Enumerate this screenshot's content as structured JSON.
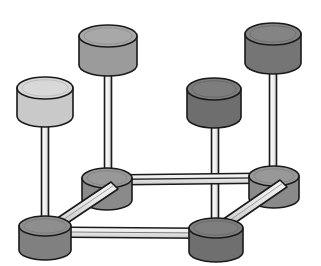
{
  "scene": {
    "title": "3D isometric cylinder-and-strut structure",
    "background_color": "#ffffff",
    "width": 321,
    "height": 266,
    "outline_color": "#1a1a1a",
    "node_count": 8,
    "strut_count": 4,
    "pole_count": 4
  },
  "palette": {
    "light_gray": "#c9c9c9",
    "light_gray_top": "#d8d8d8",
    "medium_gray": "#9b9b9b",
    "medium_gray_top": "#a8a8a8",
    "dark_gray": "#6e6e6e",
    "dark_gray_top": "#7d7d7d",
    "base_gray": "#8a8a8a",
    "base_gray_top": "#989898",
    "strut_light": "#e8e8e8",
    "strut_shade": "#c4c4c4",
    "pole_light": "#f2f2f2",
    "pole_shade": "#cfcfcf",
    "outline": "#1a1a1a"
  },
  "top_cylinders": [
    {
      "id": "top-cylinder-left",
      "label": "Light gray cap",
      "shade": "light",
      "fill": "#c9c9c9",
      "top_fill": "#d8d8d8",
      "cx": 45,
      "cy": 88,
      "rx": 28,
      "ry": 11,
      "body_height": 28
    },
    {
      "id": "top-cylinder-back-left",
      "label": "Medium gray cap",
      "shade": "medium",
      "fill": "#9b9b9b",
      "top_fill": "#a8a8a8",
      "cx": 108,
      "cy": 36,
      "rx": 29,
      "ry": 11,
      "body_height": 29
    },
    {
      "id": "top-cylinder-center-right",
      "label": "Dark gray cap",
      "shade": "dark",
      "fill": "#6e6e6e",
      "top_fill": "#7d7d7d",
      "cx": 214,
      "cy": 89,
      "rx": 27,
      "ry": 11,
      "body_height": 28
    },
    {
      "id": "top-cylinder-back-right",
      "label": "Dark gray cap",
      "shade": "dark",
      "fill": "#757575",
      "top_fill": "#848484",
      "cx": 273,
      "cy": 34,
      "rx": 28,
      "ry": 11,
      "body_height": 29
    }
  ],
  "base_nodes": [
    {
      "id": "base-node-back-left",
      "label": "Back-left base node",
      "fill": "#8a8a8a",
      "top_fill": "#989898",
      "cx": 107,
      "cy": 178,
      "rx": 25,
      "ry": 10,
      "body_height": 22
    },
    {
      "id": "base-node-back-right",
      "label": "Back-right base node",
      "fill": "#8a8a8a",
      "top_fill": "#989898",
      "cx": 274,
      "cy": 176,
      "rx": 25,
      "ry": 10,
      "body_height": 22
    },
    {
      "id": "base-node-front-left",
      "label": "Front-left base node",
      "fill": "#808080",
      "top_fill": "#8e8e8e",
      "cx": 45,
      "cy": 226,
      "rx": 26,
      "ry": 10,
      "body_height": 24
    },
    {
      "id": "base-node-front-right",
      "label": "Front-right base node",
      "fill": "#6f6f6f",
      "top_fill": "#7e7e7e",
      "cx": 216,
      "cy": 228,
      "rx": 27,
      "ry": 10,
      "body_height": 24
    }
  ],
  "poles": [
    {
      "id": "pole-front-left",
      "label": "Vertical pole front-left",
      "top_x": 45,
      "top_y": 99,
      "bottom_x": 45,
      "bottom_y": 226,
      "width": 7
    },
    {
      "id": "pole-back-left",
      "label": "Vertical pole back-left",
      "top_x": 108,
      "top_y": 48,
      "bottom_x": 108,
      "bottom_y": 178,
      "width": 7
    },
    {
      "id": "pole-front-right",
      "label": "Vertical pole front-right",
      "top_x": 215,
      "top_y": 100,
      "bottom_x": 216,
      "bottom_y": 228,
      "width": 7
    },
    {
      "id": "pole-back-right",
      "label": "Vertical pole back-right",
      "top_x": 273,
      "top_y": 46,
      "bottom_x": 274,
      "bottom_y": 176,
      "width": 7
    }
  ],
  "struts": [
    {
      "id": "strut-back-horizontal",
      "label": "Back horizontal strut",
      "from": "base-node-back-left",
      "to": "base-node-back-right",
      "x1": 120,
      "y1": 181,
      "x2": 265,
      "y2": 179,
      "width": 8
    },
    {
      "id": "strut-front-horizontal",
      "label": "Front horizontal strut",
      "from": "base-node-front-left",
      "to": "base-node-front-right",
      "x1": 62,
      "y1": 231,
      "x2": 202,
      "y2": 232,
      "width": 8
    },
    {
      "id": "strut-left-diagonal",
      "label": "Left diagonal strut",
      "from": "base-node-front-left",
      "to": "base-node-back-left",
      "x1": 56,
      "y1": 222,
      "x2": 111,
      "y2": 186,
      "width": 9
    },
    {
      "id": "strut-right-diagonal",
      "label": "Right diagonal strut",
      "from": "base-node-front-right",
      "to": "base-node-back-right",
      "x1": 227,
      "y1": 223,
      "x2": 280,
      "y2": 185,
      "width": 9
    }
  ]
}
